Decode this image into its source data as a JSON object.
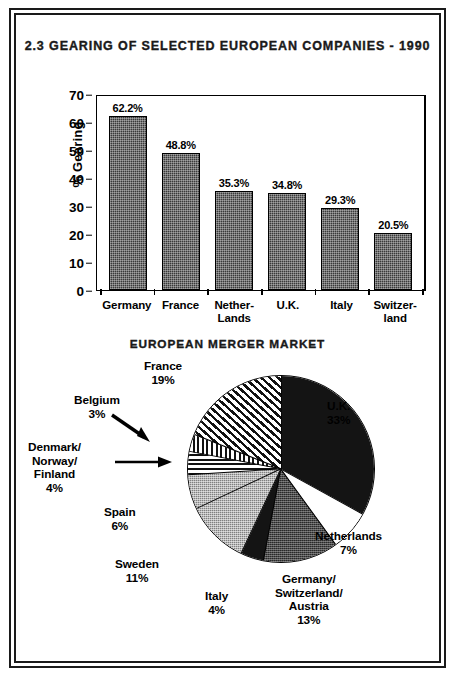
{
  "figure": {
    "bar_title": "2.3  GEARING OF SELECTED EUROPEAN\nCOMPANIES - 1990",
    "pie_title": "EUROPEAN MERGER MARKET"
  },
  "chart_data": [
    {
      "type": "bar",
      "title": "2.3  GEARING OF SELECTED EUROPEAN COMPANIES - 1990",
      "xlabel": "",
      "ylabel": "% Gearing",
      "ylim": [
        0,
        70
      ],
      "yticks": [
        0,
        10,
        20,
        30,
        40,
        50,
        60,
        70
      ],
      "grid": false,
      "legend": "none",
      "categories": [
        "Germany",
        "France",
        "Nether-\nLands",
        "U.K.",
        "Italy",
        "Switzer-\nland"
      ],
      "values": [
        62.2,
        48.8,
        35.3,
        34.8,
        29.3,
        20.5
      ],
      "data_labels": [
        "62.2%",
        "48.8%",
        "35.3%",
        "34.8%",
        "29.3%",
        "20.5%"
      ],
      "bar_fill": "dark-crosshatch"
    },
    {
      "type": "pie",
      "title": "EUROPEAN MERGER MARKET",
      "start_angle_deg": 0,
      "direction": "clockwise",
      "legend": "labels-outside",
      "slices": [
        {
          "label": "U.K.",
          "value": 33,
          "value_label": "33%",
          "fill": "solid-black",
          "label_text": "U.K.\n33%",
          "label_left": 305,
          "label_top": 42
        },
        {
          "label": "Netherlands",
          "value": 7,
          "value_label": "7%",
          "fill": "white",
          "label_text": "Netherlands\n7%",
          "label_left": 293,
          "label_top": 172
        },
        {
          "label": "Germany/Switzerland/Austria",
          "value": 13,
          "value_label": "13%",
          "fill": "dark-gray-dither",
          "label_text": "Germany/\nSwitzerland/\nAustria\n13%",
          "label_left": 253,
          "label_top": 215
        },
        {
          "label": "Italy",
          "value": 4,
          "value_label": "4%",
          "fill": "solid-black",
          "label_text": "Italy\n4%",
          "label_left": 183,
          "label_top": 232
        },
        {
          "label": "Sweden",
          "value": 11,
          "value_label": "11%",
          "fill": "light-gray-dither",
          "label_text": "Sweden\n11%",
          "label_left": 93,
          "label_top": 200
        },
        {
          "label": "Spain",
          "value": 6,
          "value_label": "6%",
          "fill": "light-gray-dither",
          "label_text": "Spain\n6%",
          "label_left": 82,
          "label_top": 148
        },
        {
          "label": "Denmark/Norway/Finland",
          "value": 4,
          "value_label": "4%",
          "fill": "horizontal-stripes",
          "label_text": "Denmark/\nNorway/\nFinland\n4%",
          "label_left": 6,
          "label_top": 83
        },
        {
          "label": "Belgium",
          "value": 3,
          "value_label": "3%",
          "fill": "vertical-stripes",
          "label_text": "Belgium\n3%",
          "label_left": 52,
          "label_top": 36
        },
        {
          "label": "France",
          "value": 19,
          "value_label": "19%",
          "fill": "diagonal-stripes",
          "label_text": "France\n19%",
          "label_left": 122,
          "label_top": 2
        }
      ]
    }
  ],
  "colors": {
    "ink": "#000000",
    "bar_fill": "#3a3a3a",
    "pie_black": "#141414",
    "pie_dark_gray": "#4a4a4a",
    "pie_light_gray": "#b7b7b7",
    "page_background": "#ffffff"
  }
}
